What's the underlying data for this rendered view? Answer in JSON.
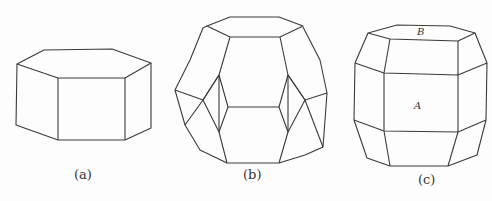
{
  "figure": {
    "panels": [
      {
        "id": "a",
        "label": "(a)",
        "shape": "hexagonal prism"
      },
      {
        "id": "b",
        "label": "(b)",
        "shape": "truncated octahedron"
      },
      {
        "id": "c",
        "label": "(c)",
        "shape": "hexagonal prism with bevelled edges",
        "face_labels": [
          "A",
          "B"
        ]
      }
    ],
    "stroke_color": "#3a3a3a"
  }
}
